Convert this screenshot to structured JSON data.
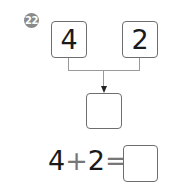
{
  "problem": {
    "number": "22",
    "addends": [
      "4",
      "2"
    ],
    "result_box": "",
    "equation": {
      "left": "4",
      "operator": "+",
      "right": "2",
      "equals": "=",
      "answer": ""
    }
  },
  "colors": {
    "badge": "#8a8a8a",
    "box_border": "#6e6e6e",
    "connector": "#9a9a9a",
    "text": "#1a1a1a"
  }
}
